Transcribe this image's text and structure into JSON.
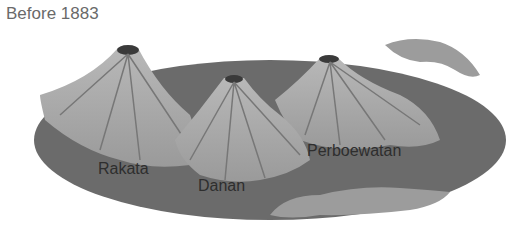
{
  "title": "Before 1883",
  "labels": {
    "rakata": "Rakata",
    "danan": "Danan",
    "perboewatan": "Perboewatan"
  },
  "colors": {
    "island": "#6b6b6b",
    "cone": "#a9a9a9",
    "title_text": "#6a6a6a",
    "label_text": "#2e2e2e"
  }
}
